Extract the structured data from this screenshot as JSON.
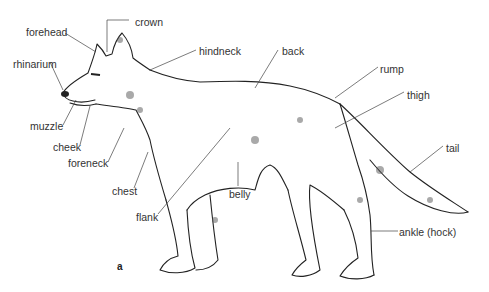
{
  "diagram": {
    "figure_label": "a",
    "labels": [
      {
        "id": "crown",
        "text": "crown",
        "x": 135,
        "y": 16
      },
      {
        "id": "forehead",
        "text": "forehead",
        "x": 26,
        "y": 26
      },
      {
        "id": "hindneck",
        "text": "hindneck",
        "x": 199,
        "y": 45
      },
      {
        "id": "back",
        "text": "back",
        "x": 282,
        "y": 45
      },
      {
        "id": "rhinarium",
        "text": "rhinarium",
        "x": 13,
        "y": 58
      },
      {
        "id": "rump",
        "text": "rump",
        "x": 380,
        "y": 63
      },
      {
        "id": "thigh",
        "text": "thigh",
        "x": 407,
        "y": 89
      },
      {
        "id": "muzzle",
        "text": "muzzle",
        "x": 30,
        "y": 120
      },
      {
        "id": "cheek",
        "text": "cheek",
        "x": 53,
        "y": 141
      },
      {
        "id": "foreneck",
        "text": "foreneck",
        "x": 68,
        "y": 157
      },
      {
        "id": "tail",
        "text": "tail",
        "x": 446,
        "y": 142
      },
      {
        "id": "chest",
        "text": "chest",
        "x": 112,
        "y": 185
      },
      {
        "id": "belly",
        "text": "belly",
        "x": 229,
        "y": 188
      },
      {
        "id": "flank",
        "text": "flank",
        "x": 136,
        "y": 211
      },
      {
        "id": "ankle",
        "text": "ankle (hock)",
        "x": 399,
        "y": 226
      }
    ]
  }
}
